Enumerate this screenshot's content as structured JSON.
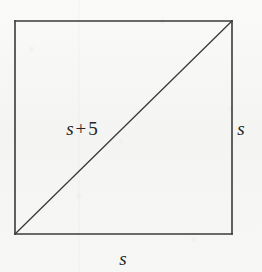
{
  "figure": {
    "type": "geometry-diagram",
    "shape": "square-with-diagonal",
    "canvas": {
      "width": 262,
      "height": 272
    },
    "background_color": "#f6f6f4",
    "stroke_color": "#3a3a3a",
    "text_color": "#262626",
    "square": {
      "left": 15,
      "top": 21,
      "right": 232,
      "bottom": 234,
      "stroke_width": 1.6
    },
    "diagonal": {
      "from": {
        "x": 15,
        "y": 234
      },
      "to": {
        "x": 232,
        "y": 21
      },
      "stroke_width": 1.3
    },
    "labels": {
      "hypotenuse": {
        "variable": "s",
        "operator": "+",
        "number": "5",
        "full_text": "s + 5",
        "position": {
          "x": 82,
          "y": 128
        }
      },
      "right_side": {
        "variable": "s",
        "full_text": "s",
        "position": {
          "x": 241,
          "y": 128
        }
      },
      "bottom_side": {
        "variable": "s",
        "full_text": "s",
        "position": {
          "x": 123,
          "y": 258
        }
      }
    }
  }
}
